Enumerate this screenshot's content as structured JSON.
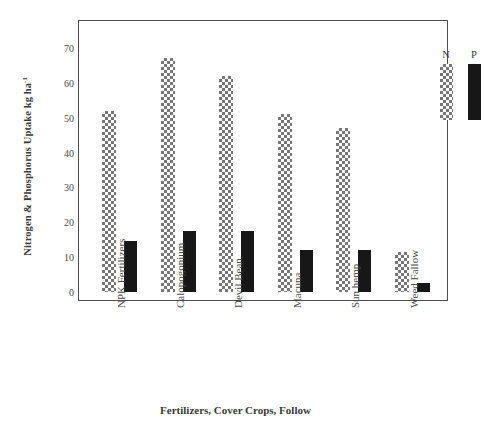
{
  "chart_data": {
    "type": "bar",
    "title": "",
    "xlabel": "Fertilizers, Cover Crops, Follow",
    "ylabel": "Nitrogen & Phosphorus Uptake kg ha",
    "ylabel_superscript": "-1",
    "categories": [
      "NPK Fertilizers",
      "Calopogonium",
      "Devil Bean",
      "Macuna",
      "Sun hemp",
      "Weed Fallow"
    ],
    "series": [
      {
        "name": "N",
        "values": [
          52,
          67,
          62,
          51,
          47,
          11.5
        ]
      },
      {
        "name": "P",
        "values": [
          14.5,
          17.5,
          17.5,
          12,
          12,
          2.5
        ]
      }
    ],
    "yticks": [
      0,
      10,
      20,
      30,
      40,
      50,
      60,
      70
    ],
    "ylim": [
      0,
      76
    ],
    "grid": false,
    "legend_position": "top-right",
    "legend_entries": [
      "N",
      "P"
    ]
  },
  "legend": {
    "entries": [
      {
        "label": "N",
        "swatch": "checkered-swatch"
      },
      {
        "label": "P",
        "swatch": "solid-black-swatch"
      }
    ]
  },
  "colors": {
    "series_n": "#777777",
    "series_p": "#171717",
    "axis": "#4d4d4d",
    "text": "#3a3a3a",
    "background": "#ffffff"
  }
}
